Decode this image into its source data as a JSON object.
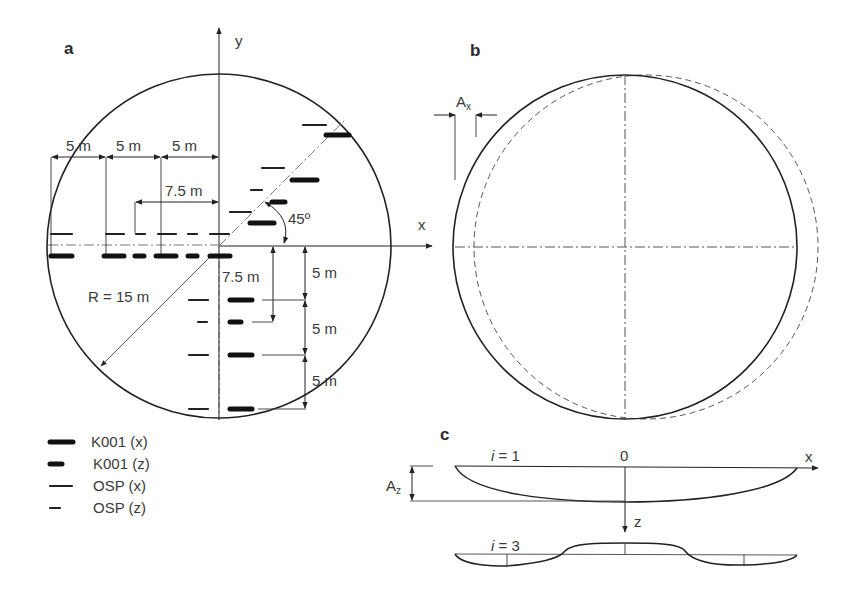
{
  "panels": {
    "a": {
      "label": "a",
      "axis_x": "x",
      "axis_y": "y",
      "radius_label": "R = 15 m",
      "angle_label": "45º",
      "horizontal_dims": [
        "5 m",
        "5 m",
        "5 m",
        "7.5 m"
      ],
      "vertical_dims": [
        "7.5 m",
        "5 m",
        "5 m",
        "5 m"
      ]
    },
    "b": {
      "label": "b",
      "amplitude_label": "A",
      "amplitude_sub": "x"
    },
    "c": {
      "label": "c",
      "mode1_label_i": "i",
      "mode1_label_rest": " = 1",
      "mode3_label_i": "i",
      "mode3_label_rest": " = 3",
      "origin_label": "0",
      "axis_x": "x",
      "axis_z": "z",
      "amplitude_label": "A",
      "amplitude_sub": "z"
    }
  },
  "legend": [
    {
      "label": "K001 (x)",
      "style": "thick-long"
    },
    {
      "label": "K001 (z)",
      "style": "thick-short"
    },
    {
      "label": "OSP (x)",
      "style": "thin-long"
    },
    {
      "label": "OSP (z)",
      "style": "thin-short"
    }
  ],
  "colors": {
    "line": "#222222",
    "dashed": "#555555",
    "text": "#3a3a3a"
  }
}
